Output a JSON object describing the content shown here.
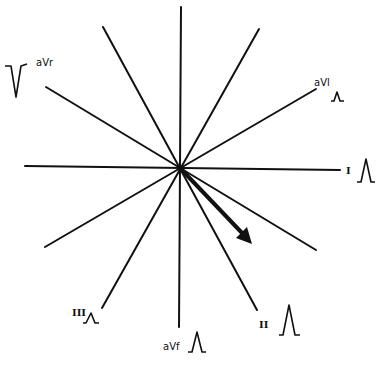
{
  "diagram": {
    "center": {
      "x": 180,
      "y": 168
    },
    "axis_arrow": {
      "from": [
        180,
        168
      ],
      "to": [
        252,
        243
      ],
      "meaning": "mean electrical axis (~+45° to +60°)"
    },
    "leads": [
      {
        "id": "I",
        "label": "I",
        "wave": "upright-tall"
      },
      {
        "id": "II",
        "label": "II",
        "wave": "upright-tall"
      },
      {
        "id": "III",
        "label": "III",
        "wave": "upright-small"
      },
      {
        "id": "aVr",
        "label": "aVr",
        "wave": "inverted-tall"
      },
      {
        "id": "aVl",
        "label": "aVl",
        "wave": "upright-small"
      },
      {
        "id": "aVf",
        "label": "aVf",
        "wave": "upright-tall"
      }
    ],
    "colors": {
      "line": "#111111",
      "background": "#ffffff"
    }
  }
}
